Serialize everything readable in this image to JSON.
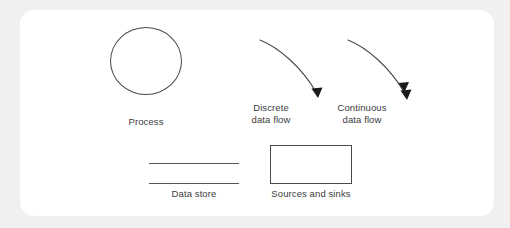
{
  "figure": {
    "background_color": "#f0f0f0",
    "canvas_color": "#ffffff",
    "stroke_color": "#4a4a4a",
    "text_color": "#3b3b3b"
  },
  "legend": {
    "items": [
      {
        "id": "process",
        "shape": "circle",
        "caption": "Process"
      },
      {
        "id": "discrete-data-flow",
        "shape": "curved-arrow-single-head",
        "caption_line1": "Discrete",
        "caption_line2": "data flow"
      },
      {
        "id": "continuous-data-flow",
        "shape": "curved-arrow-double-head",
        "caption_line1": "Continuous",
        "caption_line2": "data flow"
      },
      {
        "id": "data-store",
        "shape": "two-parallel-lines",
        "caption": "Data store"
      },
      {
        "id": "sources-and-sinks",
        "shape": "rectangle",
        "caption": "Sources and sinks"
      }
    ]
  }
}
